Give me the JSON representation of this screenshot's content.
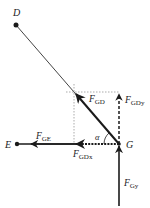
{
  "diagram": {
    "type": "force-diagram",
    "points": {
      "D": {
        "label": "D"
      },
      "E": {
        "label": "E"
      },
      "G": {
        "label": "G"
      }
    },
    "forces": {
      "F_GD": {
        "symbol": "F",
        "subscript": "GD",
        "style": "solid",
        "direction": "G to upper-left"
      },
      "F_GDy": {
        "symbol": "F",
        "subscript": "GDy",
        "style": "dashed",
        "direction": "up"
      },
      "F_GDx": {
        "symbol": "F",
        "subscript": "GDx",
        "style": "dashed",
        "direction": "left"
      },
      "F_GE": {
        "symbol": "F",
        "subscript": "GE",
        "style": "solid",
        "direction": "left toward E"
      },
      "F_Gy": {
        "symbol": "F",
        "subscript": "Gy",
        "style": "solid",
        "direction": "up into G"
      }
    },
    "angle": {
      "label": "α"
    },
    "colors": {
      "line": "#1a1a1a",
      "guide": "#888888"
    }
  }
}
